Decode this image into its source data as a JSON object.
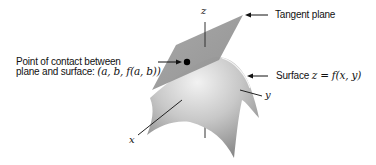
{
  "figure": {
    "type": "3d-surface-tangent-plane",
    "labels": {
      "tangent_plane": "Tangent plane",
      "contact_line1": "Point of contact between",
      "contact_line2": "plane and surface: ",
      "contact_point": "(a, b, f(a, b))",
      "surface_prefix": "Surface ",
      "surface_eq": "z = f(x, y)",
      "axis_x": "x",
      "axis_y": "y",
      "axis_z": "z"
    },
    "colors": {
      "plane": "#9a9a9a",
      "surface_light": "#e6e6e6",
      "surface_dark": "#8a8a8a",
      "text": "#111111",
      "background": "#ffffff"
    }
  }
}
